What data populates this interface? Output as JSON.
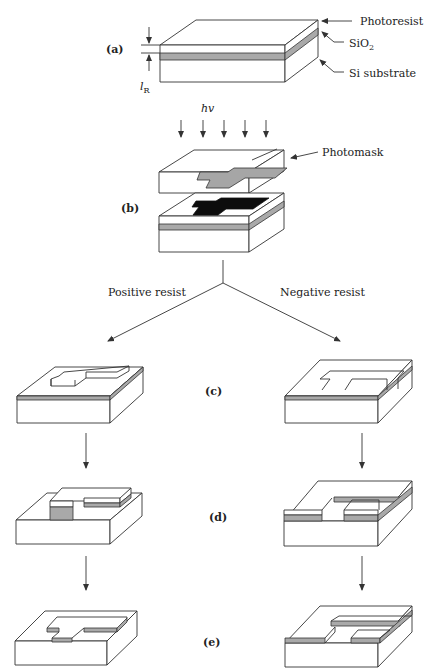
{
  "figure": {
    "labels": {
      "photoresist": "Photoresist",
      "sio2_base": "SiO",
      "sio2_sub": "2",
      "substrate": "Si substrate",
      "thickness_base": "l",
      "thickness_sub": "R",
      "light": "hv",
      "photomask": "Photomask",
      "positive": "Positive resist",
      "negative": "Negative resist"
    },
    "steps": [
      {
        "id": "a",
        "label": "(a)"
      },
      {
        "id": "b",
        "label": "(b)"
      },
      {
        "id": "c",
        "label": "(c)"
      },
      {
        "id": "d",
        "label": "(d)"
      },
      {
        "id": "e",
        "label": "(e)"
      }
    ],
    "colors": {
      "oxide": "#a9a9a9",
      "exposed_resist": "#0d0d0d",
      "mask_pattern": "#a6a6a6",
      "line": "#333333"
    }
  }
}
